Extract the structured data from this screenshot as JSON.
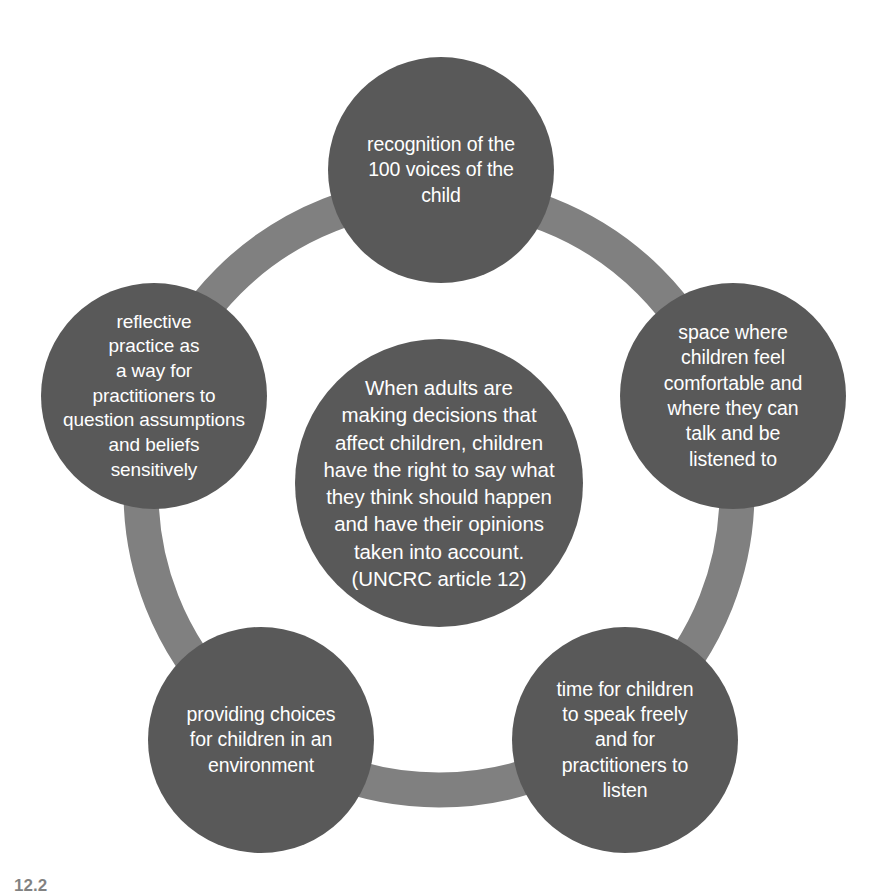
{
  "diagram": {
    "type": "cycle-hub-and-spoke",
    "ring_color": "#808080",
    "node_color": "#595959",
    "node_text_color": "#ffffff",
    "background_color": "#ffffff",
    "centre": {
      "id": "centre",
      "text": "When adults are\nmaking decisions that\naffect children, children\nhave the right to say what\nthey think should happen\nand have their opinions\ntaken into account.\n(UNCRC article 12)",
      "source": "UNCRC article 12"
    },
    "nodes": [
      {
        "id": "top",
        "position": "top",
        "text": "recognition of the\n100 voices of the\nchild"
      },
      {
        "id": "right",
        "position": "right",
        "text": "space where\nchildren feel\ncomfortable and\nwhere they can\ntalk and be\nlistened to"
      },
      {
        "id": "bottom-right",
        "position": "bottom-right",
        "text": "time for children\nto speak freely\nand for\npractitioners to\nlisten"
      },
      {
        "id": "bottom-left",
        "position": "bottom-left",
        "text": "providing choices\nfor children in an\nenvironment"
      },
      {
        "id": "left",
        "position": "left",
        "text": "reflective\npractice as\na way for\npractitioners to\nquestion assumptions\nand beliefs\nsensitively"
      }
    ],
    "caption": "12.2"
  }
}
